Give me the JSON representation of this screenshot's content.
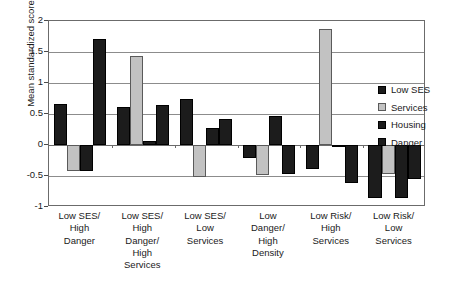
{
  "chart_data": {
    "type": "bar",
    "title": "",
    "subtitle": "",
    "xlabel": "",
    "ylabel": "Mean standardized score",
    "ylim": [
      -1,
      2
    ],
    "yticks": [
      -1,
      -0.5,
      0,
      0.5,
      1,
      1.5,
      2
    ],
    "ytick_labels": [
      "-1",
      "-0.5",
      "0",
      "0.5",
      "1",
      "1.5",
      "2"
    ],
    "grid": true,
    "legend_position": "right",
    "categories": [
      "Low SES/ High Danger",
      "Low SES/ High Danger/ High Services",
      "Low SES/ Low Services",
      "Low Danger/ High Density",
      "Low Risk/ High Services",
      "Low Risk/ Low Services"
    ],
    "category_lines": [
      [
        "Low SES/",
        "High",
        "Danger"
      ],
      [
        "Low SES/",
        "High",
        "Danger/",
        "High",
        "Services"
      ],
      [
        "Low SES/",
        "Low",
        "Services"
      ],
      [
        "Low",
        "Danger/",
        "High",
        "Density"
      ],
      [
        "Low Risk/",
        "High",
        "Services"
      ],
      [
        "Low Risk/",
        "Low",
        "Services"
      ]
    ],
    "series": [
      {
        "name": "Low SES",
        "color": "#1c1c1c",
        "values": [
          0.66,
          0.61,
          0.74,
          -0.21,
          -0.39,
          -0.85
        ]
      },
      {
        "name": "Services",
        "color": "#c2c2c2",
        "values": [
          -0.42,
          1.43,
          -0.51,
          -0.48,
          1.87,
          -0.46
        ]
      },
      {
        "name": "Housing",
        "color": "#1c1c1c",
        "values": [
          -0.42,
          0.07,
          0.27,
          0.47,
          0.0,
          -0.85
        ]
      },
      {
        "name": "Danger",
        "color": "#1c1c1c",
        "values": [
          1.71,
          0.64,
          0.42,
          -0.47,
          -0.62,
          -0.55
        ]
      }
    ]
  },
  "legend": {
    "entries": [
      {
        "label": "Low SES"
      },
      {
        "label": "Services"
      },
      {
        "label": "Housing"
      },
      {
        "label": "Danger"
      }
    ]
  }
}
